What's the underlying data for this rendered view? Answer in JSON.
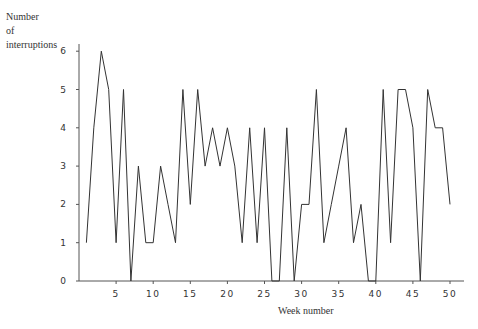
{
  "chart_data": {
    "type": "line",
    "title": "",
    "xlabel": "Week number",
    "ylabel": "Number of interruptions",
    "ylabel_lines": [
      "Number",
      "of",
      "interruptions"
    ],
    "x": [
      1,
      2,
      3,
      4,
      5,
      6,
      7,
      8,
      9,
      10,
      11,
      12,
      13,
      14,
      15,
      16,
      17,
      18,
      19,
      20,
      21,
      22,
      23,
      24,
      25,
      26,
      27,
      28,
      29,
      30,
      31,
      32,
      33,
      34,
      35,
      36,
      37,
      38,
      39,
      40,
      41,
      42,
      43,
      44,
      45,
      46,
      47,
      48,
      49,
      50
    ],
    "values": [
      1,
      4,
      6,
      5,
      1,
      5,
      0,
      3,
      1,
      1,
      3,
      2,
      1,
      5,
      2,
      5,
      3,
      4,
      3,
      4,
      3,
      1,
      4,
      1,
      4,
      0,
      0,
      4,
      0,
      2,
      2,
      5,
      1,
      2,
      3,
      4,
      1,
      2,
      0,
      0,
      5,
      1,
      5,
      5,
      4,
      0,
      5,
      4,
      4,
      2
    ],
    "xticks": [
      "5",
      "10",
      "15",
      "20",
      "25",
      "30",
      "35",
      "40",
      "45",
      "50"
    ],
    "xtick_values": [
      5,
      10,
      15,
      20,
      25,
      30,
      35,
      40,
      45,
      50
    ],
    "yticks": [
      "0",
      "1",
      "2",
      "3",
      "4",
      "5",
      "6"
    ],
    "ylim": [
      0,
      6
    ],
    "xlim": [
      0,
      52
    ],
    "grid": false,
    "legend": null,
    "line_color": "#333333"
  }
}
